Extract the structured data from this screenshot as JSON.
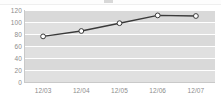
{
  "chart_data": {
    "type": "line",
    "title": "",
    "subtitle": "",
    "xlabel": "",
    "ylabel": "",
    "categories": [
      "12/03",
      "12/04",
      "12/05",
      "12/06",
      "12/07"
    ],
    "series": [
      {
        "name": "series-1",
        "values": [
          76,
          85,
          98,
          111,
          110
        ],
        "color": "#3a3a3a",
        "marker": "circle-open",
        "marker_fill": "#ffffff"
      }
    ],
    "ylim": [
      0,
      120
    ],
    "yticks": [
      120,
      100,
      80,
      60,
      40,
      20,
      0
    ],
    "ytick_labels": [
      "120",
      "100",
      "80",
      "60",
      "40",
      "20",
      "0"
    ],
    "grid": true,
    "grid_orientation": "horizontal",
    "grid_color": "#ffffff",
    "plot_background": "#e0e0e0",
    "plot_band_color": "#d9d9d9",
    "axis_color": "#c9c9c9",
    "tick_label_color": "#8c8c8c",
    "legend": null,
    "legend_position": "none"
  },
  "widget": {
    "background": "#ffffff"
  }
}
